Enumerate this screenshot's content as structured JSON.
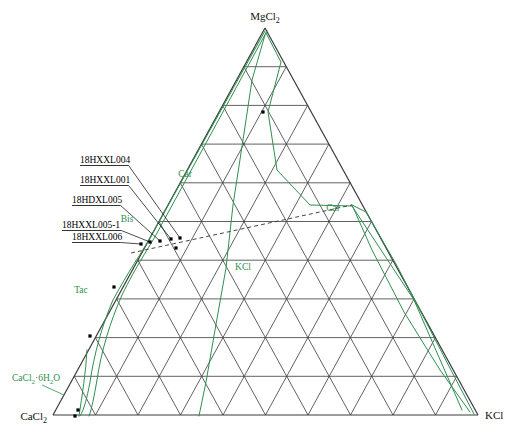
{
  "figure": {
    "kind": "ternary-phase-diagram",
    "system": "CaCl2 - MgCl2 - KCl",
    "background": "#ffffff",
    "grid_divisions": 10,
    "colors": {
      "grid": "#3a3a3a",
      "boundary_green": "#2f8f4e",
      "tie_line_dashed": "#333333",
      "leader_line": "#000000",
      "point": "#000000",
      "text": "#111111"
    }
  },
  "vertices": {
    "top": {
      "name": "MgCl2",
      "main": "MgCl",
      "sub": "2",
      "x": 265,
      "y": 28
    },
    "bottom_left": {
      "name": "CaCl2",
      "main": "CaCl",
      "sub": "2",
      "x": 53,
      "y": 415
    },
    "bottom_right": {
      "name": "KCl",
      "main": "KCl",
      "sub": "",
      "x": 478,
      "y": 415
    }
  },
  "phase_fields": [
    {
      "id": "car-left",
      "label": "Car",
      "sub": "",
      "x": 185,
      "y": 177
    },
    {
      "id": "car-right",
      "label": "Car",
      "sub": "",
      "x": 333,
      "y": 211
    },
    {
      "id": "bis",
      "label": "Bis",
      "sub": "",
      "x": 127,
      "y": 222
    },
    {
      "id": "kcl",
      "label": "KCl",
      "sub": "",
      "x": 243,
      "y": 270
    },
    {
      "id": "tac",
      "label": "Tac",
      "sub": "",
      "x": 81,
      "y": 293
    },
    {
      "id": "cacl2-6h2o",
      "label": "CaCl",
      "sub": "2·6H2O",
      "x": 12,
      "y": 381
    }
  ],
  "phase_label_cacl2_6h2o": {
    "part1": "CaCl",
    "sub1": "2",
    "part2": "·6H",
    "sub2": "2",
    "part3": "O"
  },
  "samples": [
    {
      "id": "18HXXL004",
      "label": "18HXXL004",
      "label_x": 80,
      "label_y": 163,
      "point_x": 180,
      "point_y": 238
    },
    {
      "id": "18HXXL001",
      "label": "18HXXL001",
      "label_x": 80,
      "label_y": 183,
      "point_x": 171,
      "point_y": 239
    },
    {
      "id": "18HDXL005",
      "label": "18HDXL005",
      "label_x": 72,
      "label_y": 203,
      "point_x": 160,
      "point_y": 241
    },
    {
      "id": "18HXXL005-1",
      "label": "18HXXL005-1",
      "label_x": 62,
      "label_y": 228,
      "point_x": 150,
      "point_y": 242
    },
    {
      "id": "18HXXL006",
      "label": "18HXXL006",
      "label_x": 72,
      "label_y": 240,
      "point_x": 141,
      "point_y": 244
    }
  ],
  "data_points": [
    {
      "x": 141,
      "y": 244
    },
    {
      "x": 150,
      "y": 242
    },
    {
      "x": 160,
      "y": 241
    },
    {
      "x": 171,
      "y": 239
    },
    {
      "x": 180,
      "y": 238
    },
    {
      "x": 176,
      "y": 248
    },
    {
      "x": 263,
      "y": 112
    },
    {
      "x": 114,
      "y": 287
    },
    {
      "x": 90,
      "y": 336
    },
    {
      "x": 78,
      "y": 410
    },
    {
      "x": 75,
      "y": 416
    }
  ],
  "tie_line": {
    "style": "dashed",
    "from_x": 131,
    "from_y": 253,
    "to_x": 352,
    "to_y": 205
  },
  "chart_data": {
    "type": "ternary",
    "title": "",
    "axes": [
      "CaCl2",
      "MgCl2",
      "KCl"
    ],
    "grid": true,
    "grid_divisions": 10,
    "legend": [
      "Car",
      "Bis",
      "KCl",
      "Tac",
      "CaCl2·6H2O"
    ],
    "annotations": [
      "18HXXL004",
      "18HXXL001",
      "18HDXL005",
      "18HXXL005-1",
      "18HXXL006"
    ]
  }
}
